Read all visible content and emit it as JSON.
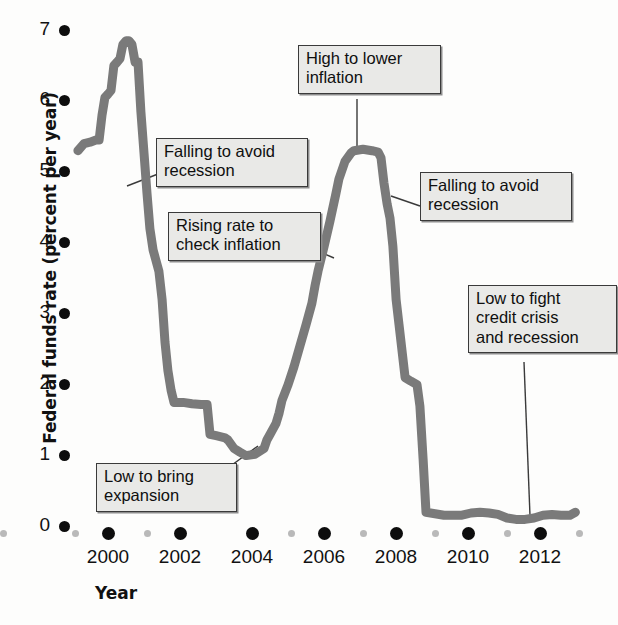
{
  "chart_data": {
    "type": "line",
    "title": "",
    "xlabel": "Year",
    "ylabel": "Federal funds rate (percent per year)",
    "xlim": [
      1999.0,
      2013.2
    ],
    "ylim": [
      0,
      7.35
    ],
    "grid": false,
    "legend": null,
    "line_color": "#7a7a7a",
    "xticks_major": [
      "2000",
      "2002",
      "2004",
      "2006",
      "2008",
      "2010",
      "2012"
    ],
    "xticks_major_values": [
      2000,
      2002,
      2004,
      2006,
      2008,
      2010,
      2012
    ],
    "xticks_minor_values": [
      1999,
      2001,
      2003,
      2005,
      2007,
      2009,
      2011,
      2013
    ],
    "yticks": [
      "0",
      "1",
      "2",
      "3",
      "4",
      "5",
      "6",
      "7"
    ],
    "ytick_values": [
      0,
      1,
      2,
      3,
      4,
      5,
      6,
      7
    ],
    "series": [
      {
        "name": "Federal funds rate",
        "x": [
          1999.33,
          1999.5,
          1999.67,
          1999.83,
          1999.92,
          2000.0,
          2000.08,
          2000.17,
          2000.25,
          2000.33,
          2000.42,
          2000.5,
          2000.58,
          2000.67,
          2000.75,
          2000.83,
          2000.92,
          2001.0,
          2001.08,
          2001.17,
          2001.25,
          2001.33,
          2001.42,
          2001.5,
          2001.58,
          2001.67,
          2001.75,
          2001.83,
          2001.92,
          2002.0,
          2002.25,
          2002.5,
          2002.75,
          2002.92,
          2003.0,
          2003.17,
          2003.42,
          2003.5,
          2003.67,
          2003.83,
          2004.0,
          2004.25,
          2004.5,
          2004.58,
          2004.67,
          2004.83,
          2004.92,
          2005.0,
          2005.17,
          2005.33,
          2005.5,
          2005.67,
          2005.83,
          2005.92,
          2006.0,
          2006.17,
          2006.33,
          2006.5,
          2006.58,
          2006.75,
          2006.92,
          2007.0,
          2007.25,
          2007.5,
          2007.67,
          2007.75,
          2007.83,
          2007.92,
          2008.0,
          2008.08,
          2008.17,
          2008.25,
          2008.42,
          2008.58,
          2008.75,
          2008.83,
          2008.92,
          2009.0,
          2009.25,
          2009.5,
          2009.75,
          2010.0,
          2010.25,
          2010.5,
          2010.75,
          2011.0,
          2011.25,
          2011.5,
          2011.75,
          2012.0,
          2012.25,
          2012.5,
          2012.75,
          2013.0,
          2013.15
        ],
        "y": [
          5.3,
          5.4,
          5.42,
          5.45,
          5.45,
          5.8,
          6.05,
          6.1,
          6.15,
          6.5,
          6.55,
          6.6,
          6.8,
          6.85,
          6.85,
          6.8,
          6.55,
          6.55,
          5.85,
          5.25,
          4.7,
          4.2,
          3.9,
          3.75,
          3.6,
          3.2,
          2.6,
          2.2,
          1.92,
          1.75,
          1.75,
          1.73,
          1.72,
          1.72,
          1.3,
          1.28,
          1.25,
          1.22,
          1.1,
          1.05,
          1.0,
          1.02,
          1.1,
          1.22,
          1.3,
          1.45,
          1.6,
          1.78,
          2.0,
          2.25,
          2.55,
          2.85,
          3.15,
          3.4,
          3.6,
          3.95,
          4.3,
          4.7,
          4.9,
          5.15,
          5.27,
          5.3,
          5.32,
          5.3,
          5.28,
          5.2,
          4.85,
          4.55,
          4.35,
          3.95,
          3.2,
          2.85,
          2.1,
          2.05,
          2.0,
          1.7,
          0.95,
          0.2,
          0.18,
          0.16,
          0.16,
          0.16,
          0.19,
          0.2,
          0.19,
          0.17,
          0.12,
          0.1,
          0.1,
          0.12,
          0.16,
          0.17,
          0.16,
          0.16,
          0.2
        ]
      }
    ],
    "annotations": [
      {
        "id": "falling-to-avoid-recession-1",
        "text": "Falling to avoid\nrecession",
        "box_x": 156,
        "box_y": 138,
        "box_w": 136,
        "leader_from": [
          158,
          174
        ],
        "leader_to": [
          127,
          186
        ]
      },
      {
        "id": "rising-rate-to-check-inflation",
        "text": "Rising rate to\ncheck inflation",
        "box_x": 168,
        "box_y": 212,
        "box_w": 137,
        "leader_from": [
          306,
          246
        ],
        "leader_to": [
          334,
          258
        ]
      },
      {
        "id": "high-to-lower-inflation",
        "text": "High to lower\ninflation",
        "box_x": 298,
        "box_y": 45,
        "box_w": 127,
        "leader_from": [
          357,
          99
        ],
        "leader_to": [
          357,
          152
        ]
      },
      {
        "id": "falling-to-avoid-recession-2",
        "text": "Falling to avoid\nrecession",
        "box_x": 420,
        "box_y": 172,
        "box_w": 136,
        "leader_from": [
          420,
          206
        ],
        "leader_to": [
          391,
          196
        ]
      },
      {
        "id": "low-to-fight-credit-crisis",
        "text": "Low to fight\ncredit crisis\nand recession",
        "box_x": 468,
        "box_y": 285,
        "box_w": 133,
        "leader_from": [
          524,
          362
        ],
        "leader_to": [
          530,
          516
        ]
      },
      {
        "id": "low-to-bring-expansion",
        "text": "Low to bring\nexpansion",
        "box_x": 96,
        "box_y": 463,
        "box_w": 125,
        "leader_from": [
          221,
          473
        ],
        "leader_to": [
          258,
          446
        ]
      }
    ]
  }
}
